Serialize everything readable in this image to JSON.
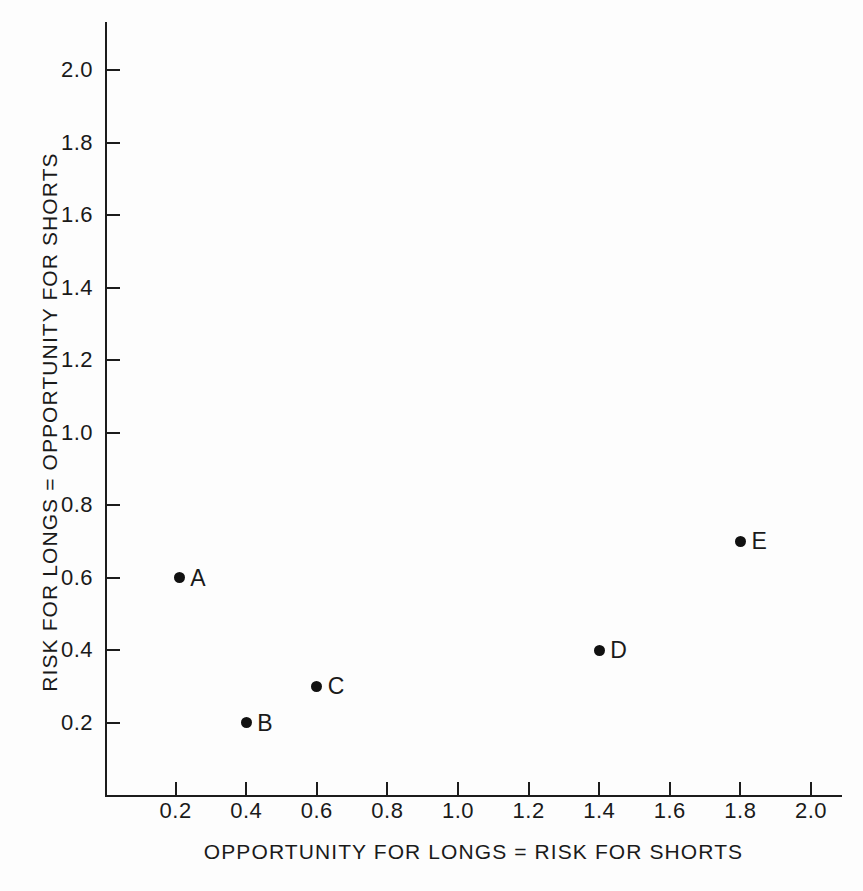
{
  "chart_data": {
    "type": "scatter",
    "title": "",
    "xlabel": "OPPORTUNITY FOR LONGS = RISK FOR SHORTS",
    "ylabel": "RISK FOR LONGS = OPPORTUNITY FOR SHORTS",
    "xlim": [
      0.0,
      2.1
    ],
    "ylim": [
      0.0,
      2.13
    ],
    "grid": false,
    "legend": "none",
    "xticks": [
      0.2,
      0.4,
      0.6,
      0.8,
      1.0,
      1.2,
      1.4,
      1.6,
      1.8,
      2.0
    ],
    "xticklabels": [
      "0.2",
      "0.4",
      "0.6",
      "0.8",
      "1.0",
      "1.2",
      "1.4",
      "1.6",
      "1.8",
      "2.0"
    ],
    "yticks": [
      0.2,
      0.4,
      0.6,
      0.8,
      1.0,
      1.2,
      1.4,
      1.6,
      1.8,
      2.0
    ],
    "yticklabels": [
      "0.2",
      "0.4",
      "0.6",
      "0.8",
      "1.0",
      "1.2",
      "1.4",
      "1.6",
      "1.8",
      "2.0"
    ],
    "marker": "filled-circle",
    "marker_color": "#111111",
    "axis_color": "#1c1c1c",
    "background_color": "#fdfdfd",
    "points": [
      {
        "label": "A",
        "x": 0.21,
        "y": 0.6
      },
      {
        "label": "B",
        "x": 0.4,
        "y": 0.2
      },
      {
        "label": "C",
        "x": 0.6,
        "y": 0.3
      },
      {
        "label": "D",
        "x": 1.4,
        "y": 0.4
      },
      {
        "label": "E",
        "x": 1.8,
        "y": 0.7
      }
    ]
  }
}
